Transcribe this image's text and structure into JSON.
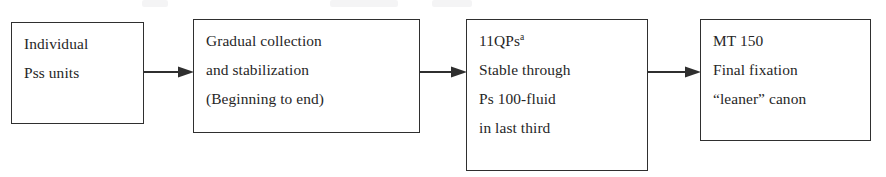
{
  "figure": {
    "type": "horizontal-flowchart",
    "stage_count": 4,
    "ink_color": "#2f2f2f",
    "text_color": "#262626",
    "background_color": "#ffffff",
    "stages": [
      {
        "id": "stage-1",
        "lines": [
          "Individual",
          "Pss units"
        ],
        "x": 11,
        "y": 22,
        "width": 133,
        "height": 102
      },
      {
        "id": "stage-2",
        "lines": [
          "Gradual collection",
          "and stabilization",
          "(Beginning to end)"
        ],
        "x": 193,
        "y": 19,
        "width": 227,
        "height": 114
      },
      {
        "id": "stage-3",
        "lines": [
          "11QPs",
          "Stable through",
          "Ps 100-fluid",
          "in last third"
        ],
        "superscript": "a",
        "superscript_on_line": 0,
        "x": 466,
        "y": 19,
        "width": 182,
        "height": 152
      },
      {
        "id": "stage-4",
        "lines": [
          "MT 150",
          "Final fixation",
          "“leaner” canon"
        ],
        "x": 700,
        "y": 19,
        "width": 171,
        "height": 122
      }
    ],
    "connectors": [
      {
        "id": "arrow-1-to-2",
        "from": "stage-1",
        "to": "stage-2",
        "x": 144,
        "y": 66,
        "length": 49
      },
      {
        "id": "arrow-2-to-3",
        "from": "stage-2",
        "to": "stage-3",
        "x": 420,
        "y": 66,
        "length": 46
      },
      {
        "id": "arrow-3-to-4",
        "from": "stage-3",
        "to": "stage-4",
        "x": 648,
        "y": 66,
        "length": 52
      }
    ]
  }
}
